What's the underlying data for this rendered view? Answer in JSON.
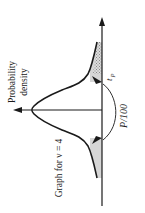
{
  "figure": {
    "type": "t-distribution probability density graph (rotated 90 degrees counter-clockwise)",
    "y_axis_label_line1": "Probability",
    "y_axis_label_line2": "density",
    "curve_label": "Graph for ν = 4",
    "critical_value_label_main": "t",
    "critical_value_label_sub": "P",
    "tail_area_label": "P/100",
    "degrees_of_freedom": 4,
    "colors": {
      "ink": "#1a1a1a",
      "shade_light": "#d8d8d8",
      "shade_dark": "#b0b0b0",
      "background": "#ffffff"
    }
  }
}
